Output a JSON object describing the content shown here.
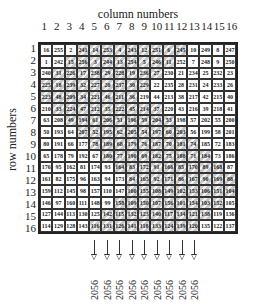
{
  "labels": {
    "column_title": "column numbers",
    "row_title": "row numbers"
  },
  "column_numbers": [
    "1",
    "2",
    "3",
    "4",
    "5",
    "6",
    "7",
    "8",
    "9",
    "10",
    "11",
    "12",
    "13",
    "14",
    "15",
    "16"
  ],
  "row_numbers": [
    "1",
    "2",
    "3",
    "4",
    "5",
    "6",
    "7",
    "8",
    "9",
    "10",
    "11",
    "12",
    "13",
    "14",
    "15",
    "16"
  ],
  "grid": [
    [
      16,
      255,
      2,
      241,
      14,
      253,
      4,
      243,
      12,
      251,
      6,
      245,
      10,
      249,
      8,
      247
    ],
    [
      1,
      242,
      15,
      256,
      3,
      244,
      13,
      254,
      5,
      246,
      11,
      252,
      7,
      248,
      9,
      250
    ],
    [
      240,
      31,
      226,
      17,
      238,
      29,
      228,
      19,
      236,
      27,
      230,
      21,
      234,
      25,
      232,
      23
    ],
    [
      225,
      18,
      239,
      32,
      227,
      20,
      237,
      30,
      229,
      22,
      235,
      28,
      231,
      24,
      233,
      26
    ],
    [
      223,
      48,
      209,
      34,
      221,
      46,
      211,
      36,
      219,
      44,
      213,
      38,
      217,
      42,
      215,
      40
    ],
    [
      210,
      33,
      224,
      47,
      212,
      35,
      222,
      45,
      214,
      37,
      220,
      43,
      216,
      39,
      218,
      41
    ],
    [
      63,
      208,
      49,
      194,
      61,
      206,
      51,
      196,
      59,
      204,
      53,
      198,
      57,
      202,
      55,
      200
    ],
    [
      50,
      193,
      64,
      207,
      52,
      195,
      62,
      205,
      54,
      197,
      60,
      203,
      56,
      199,
      58,
      201
    ],
    [
      80,
      191,
      66,
      177,
      78,
      189,
      68,
      179,
      76,
      187,
      70,
      181,
      74,
      185,
      72,
      183
    ],
    [
      65,
      178,
      79,
      192,
      67,
      180,
      77,
      190,
      69,
      182,
      75,
      188,
      71,
      184,
      73,
      186
    ],
    [
      176,
      95,
      162,
      81,
      174,
      93,
      164,
      83,
      172,
      91,
      166,
      85,
      170,
      89,
      168,
      87
    ],
    [
      161,
      82,
      175,
      96,
      163,
      94,
      173,
      84,
      165,
      92,
      171,
      86,
      167,
      90,
      169,
      88
    ],
    [
      159,
      112,
      145,
      98,
      157,
      110,
      147,
      100,
      155,
      108,
      149,
      102,
      153,
      106,
      151,
      104
    ],
    [
      146,
      97,
      160,
      111,
      148,
      99,
      158,
      109,
      150,
      107,
      156,
      101,
      154,
      103,
      152,
      105
    ],
    [
      127,
      144,
      113,
      130,
      125,
      142,
      115,
      132,
      123,
      140,
      117,
      134,
      121,
      138,
      119,
      136
    ],
    [
      114,
      129,
      128,
      143,
      116,
      131,
      126,
      141,
      118,
      133,
      124,
      139,
      120,
      135,
      122,
      137
    ]
  ],
  "shading_ranges": [
    [
      4,
      12
    ],
    [
      3,
      11
    ],
    [
      2,
      10
    ],
    [
      1,
      9
    ],
    [
      1,
      8
    ],
    [
      2,
      10
    ],
    [
      3,
      11
    ],
    [
      4,
      12
    ],
    [
      5,
      13
    ],
    [
      6,
      14
    ],
    [
      7,
      15
    ],
    [
      8,
      16
    ],
    [
      8,
      16
    ],
    [
      7,
      15
    ],
    [
      6,
      14
    ],
    [
      5,
      13
    ]
  ],
  "arrows": {
    "columns": [
      5,
      6,
      7,
      8,
      9,
      10,
      11,
      12,
      13
    ],
    "sums": [
      "2056",
      "2056",
      "2056",
      "2056",
      "2056",
      "2056",
      "2056",
      "2056",
      "2056"
    ]
  },
  "colors": {
    "shade": "#c8c8c8",
    "border": "#222222"
  }
}
